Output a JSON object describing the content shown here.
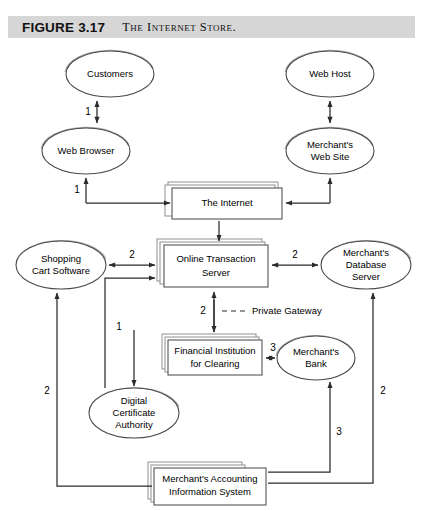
{
  "figure": {
    "number_label": "FIGURE 3.17",
    "title": "The Internet Store.",
    "header_bg": "#d6d6d6"
  },
  "nodes": {
    "customers": {
      "label": "Customers",
      "shape": "ellipse"
    },
    "web_browser": {
      "label": "Web Browser",
      "shape": "ellipse"
    },
    "web_host": {
      "label": "Web Host",
      "shape": "ellipse"
    },
    "merchants_web_site_l1": {
      "label": "Merchant's",
      "label2": "Web Site",
      "shape": "ellipse"
    },
    "the_internet": {
      "label": "The Internet",
      "shape": "stacked-box"
    },
    "shopping_cart": {
      "label": "Shopping",
      "label2": "Cart Software",
      "shape": "ellipse"
    },
    "online_transaction_server": {
      "label": "Online Transaction",
      "label2": "Server",
      "shape": "stacked-box"
    },
    "merchants_database_server": {
      "label": "Merchant's",
      "label2": "Database",
      "label3": "Server",
      "shape": "ellipse"
    },
    "financial_institution": {
      "label": "Financial Institution",
      "label2": "for Clearing",
      "shape": "stacked-box"
    },
    "merchants_bank": {
      "label": "Merchant's",
      "label2": "Bank",
      "shape": "ellipse"
    },
    "digital_certificate_authority": {
      "label": "Digital",
      "label2": "Certificate",
      "label3": "Authority",
      "shape": "ellipse"
    },
    "merchants_accounting": {
      "label": "Merchant's Accounting",
      "label2": "Information System",
      "shape": "stacked-box"
    }
  },
  "edge_labels": {
    "customers_browser": "1",
    "browser_internet": "1",
    "cart_to_ots": "2",
    "ots_to_database": "2",
    "ots_to_dca": "1",
    "private_gateway_num": "2",
    "private_gateway_text": "Private Gateway",
    "fi_to_bank": "3",
    "cart_left_vertical": "2",
    "database_right_vertical": "2",
    "bank_down_vertical": "3"
  },
  "colors": {
    "line": "#2b2b2b",
    "shadow": "#a8a8a8",
    "node_fill": "#ffffff",
    "node_stroke": "#4a4a4a"
  }
}
